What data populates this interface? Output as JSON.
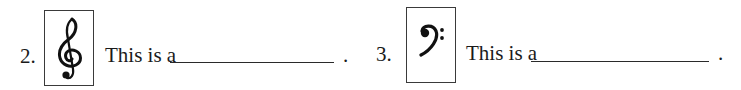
{
  "questions": [
    {
      "number": "2.",
      "clef": "treble-clef",
      "prompt": "This is a",
      "answer": "",
      "end_punct": "."
    },
    {
      "number": "3.",
      "clef": "bass-clef",
      "prompt": "This is a",
      "answer": "",
      "end_punct": "."
    }
  ]
}
